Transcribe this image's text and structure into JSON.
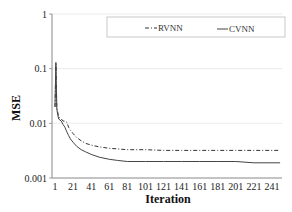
{
  "chart_data": {
    "type": "line",
    "title": "",
    "xlabel": "Iteration",
    "ylabel": "MSE",
    "yscale": "log",
    "ylim": [
      0.001,
      1
    ],
    "xlim": [
      1,
      250
    ],
    "y_ticks": [
      "1",
      "0.1",
      "0.01",
      "0.001"
    ],
    "y_tick_values": [
      1,
      0.1,
      0.01,
      0.001
    ],
    "x_ticks": [
      "1",
      "21",
      "41",
      "61",
      "81",
      "101",
      "121",
      "141",
      "161",
      "181",
      "201",
      "221",
      "241"
    ],
    "x_tick_values": [
      1,
      21,
      41,
      61,
      81,
      101,
      121,
      141,
      161,
      181,
      201,
      221,
      241
    ],
    "grid": "horizontal major gridlines (light gray)",
    "legend_position": "top-right, inside plot, single row",
    "series": [
      {
        "name": "RVNN",
        "style": "dash-dot",
        "color": "#333333",
        "x": [
          1,
          2,
          3,
          5,
          8,
          10,
          12,
          14,
          16,
          18,
          21,
          25,
          30,
          35,
          41,
          50,
          61,
          70,
          81,
          101,
          121,
          141,
          161,
          181,
          201,
          221,
          241,
          250
        ],
        "values": [
          0.02,
          0.12,
          0.02,
          0.013,
          0.012,
          0.011,
          0.011,
          0.0105,
          0.0085,
          0.0075,
          0.0065,
          0.0055,
          0.0048,
          0.0043,
          0.004,
          0.0037,
          0.0035,
          0.0034,
          0.0033,
          0.0033,
          0.0032,
          0.0032,
          0.0032,
          0.0032,
          0.0032,
          0.0032,
          0.0032,
          0.0032
        ]
      },
      {
        "name": "CVNN",
        "style": "solid",
        "color": "#444444",
        "x": [
          1,
          2,
          3,
          5,
          8,
          10,
          12,
          14,
          16,
          18,
          21,
          25,
          30,
          35,
          41,
          50,
          61,
          70,
          81,
          101,
          121,
          141,
          161,
          181,
          201,
          221,
          241,
          250
        ],
        "values": [
          0.02,
          0.13,
          0.018,
          0.012,
          0.011,
          0.0095,
          0.0085,
          0.007,
          0.006,
          0.0052,
          0.0045,
          0.0038,
          0.0033,
          0.003,
          0.0027,
          0.0024,
          0.0022,
          0.0021,
          0.002,
          0.002,
          0.002,
          0.002,
          0.002,
          0.002,
          0.002,
          0.0019,
          0.0019,
          0.0019
        ]
      }
    ]
  },
  "legend": {
    "items": [
      {
        "label": "RVNN",
        "style": "dash-dot"
      },
      {
        "label": "CVNN",
        "style": "solid"
      }
    ]
  },
  "axes": {
    "xlabel": "Iteration",
    "ylabel": "MSE"
  },
  "colors": {
    "axis": "#888888",
    "grid": "#e6e6e6",
    "legend_border": "#bbbbbb",
    "rvnn": "#333333",
    "cvnn": "#444444"
  }
}
